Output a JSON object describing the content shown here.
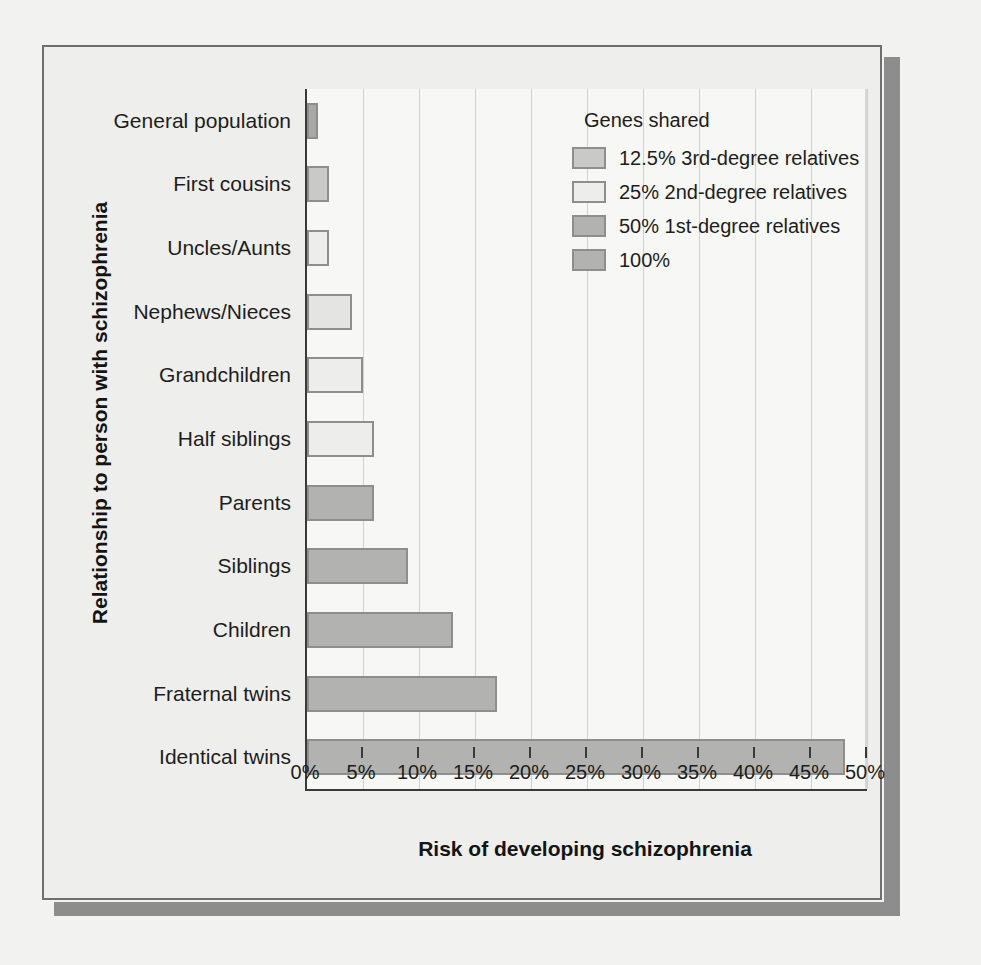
{
  "figure": {
    "background_color": "#eeeeec",
    "frame_color": "#6f6f6f",
    "shadow_color": "#8d8d8d"
  },
  "legend": {
    "title": "Genes shared",
    "items": [
      {
        "label": "12.5% 3rd-degree relatives",
        "color": "#c9c9c7"
      },
      {
        "label": "25% 2nd-degree relatives",
        "color": "#ededeb"
      },
      {
        "label": "50% 1st-degree relatives",
        "color": "#b2b2b0"
      },
      {
        "label": "100%",
        "color": "#b2b2b0"
      }
    ]
  },
  "chart_data": {
    "type": "bar",
    "orientation": "horizontal",
    "title": "",
    "xlabel": "Risk of developing schizophrenia",
    "ylabel": "Relationship to person with schizophrenia",
    "xlim": [
      0,
      50
    ],
    "xtick_step": 5,
    "xticks": [
      "0%",
      "5%",
      "10%",
      "15%",
      "20%",
      "25%",
      "30%",
      "35%",
      "40%",
      "45%",
      "50%"
    ],
    "grid": "vertical",
    "legend_position": "top-right-inside",
    "categories": [
      "General population",
      "First cousins",
      "Uncles/Aunts",
      "Nephews/Nieces",
      "Grandchildren",
      "Half siblings",
      "Parents",
      "Siblings",
      "Children",
      "Fraternal twins",
      "Identical twins"
    ],
    "values": [
      1,
      2,
      2,
      4,
      5,
      6,
      6,
      9,
      13,
      17,
      48
    ],
    "group_for_category": [
      "general",
      "12.5% 3rd-degree relatives",
      "12.5% 3rd-degree relatives",
      "25% 2nd-degree relatives",
      "25% 2nd-degree relatives",
      "25% 2nd-degree relatives",
      "50% 1st-degree relatives",
      "50% 1st-degree relatives",
      "50% 1st-degree relatives",
      "50% 1st-degree relatives",
      "100%"
    ],
    "bar_colors": [
      "#a8a8a6",
      "#c9c9c7",
      "#ededeb",
      "#e4e4e2",
      "#ededeb",
      "#ededeb",
      "#b2b2b0",
      "#b2b2b0",
      "#b2b2b0",
      "#b2b2b0",
      "#b2b2b0"
    ],
    "bar_edge_color": "#8e8e8e",
    "axis_color": "#3a3a3a",
    "gridline_color": "#d0d0cd",
    "plot_background": "#f7f7f5"
  }
}
